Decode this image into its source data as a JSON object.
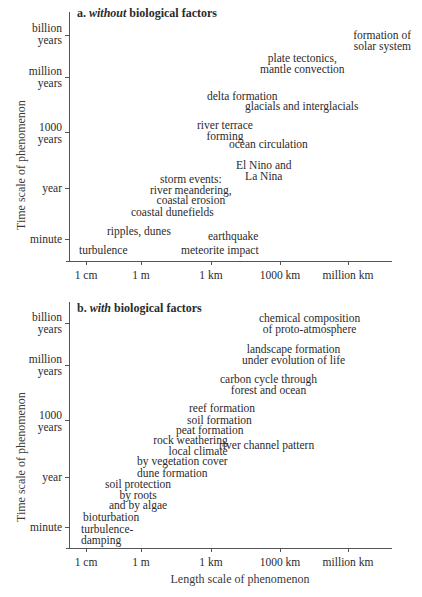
{
  "panel_a": {
    "title_prefix": "a. ",
    "title_italic": "without",
    "title_suffix": " biological factors",
    "y_axis_title": "Time scale of phenomenon",
    "y_ticks": [
      "billion\nyears",
      "million\nyears",
      "1000\nyears",
      "year",
      "minute"
    ],
    "x_ticks": [
      "1 cm",
      "1 m",
      "1 km",
      "1000 km",
      "million km"
    ],
    "items": [
      "formation of\nsolar system",
      "plate tectonics,\nmantle convection",
      "delta formation",
      "glacials and interglacials",
      "river terrace\nforming",
      "ocean circulation",
      "El Nino and\nLa Nina",
      "storm events:\nriver meandering,\ncoastal erosion",
      "coastal dunefields",
      "ripples, dunes",
      "earthquake",
      "turbulence",
      "meteorite impact"
    ]
  },
  "panel_b": {
    "title_prefix": "b. ",
    "title_italic": "with",
    "title_suffix": " biological factors",
    "y_axis_title": "Time scale of phenomenon",
    "x_axis_title": "Length scale of phenomenon",
    "y_ticks": [
      "billion\nyears",
      "million\nyears",
      "1000\nyears",
      "year",
      "minute"
    ],
    "x_ticks": [
      "1 cm",
      "1 m",
      "1 km",
      "1000 km",
      "million km"
    ],
    "items": [
      "chemical composition\nof proto-atmosphere",
      "landscape formation\nunder evolution of life",
      "carbon cycle through\nforest and ocean",
      "reef formation",
      "soil formation",
      "peat formation",
      "rock weathering\nlocal climate\nby vegetation cover",
      "river channel pattern",
      "dune formation",
      "soil protection\nby roots\nand by algae",
      "bioturbation",
      "turbulence-\ndamping"
    ]
  }
}
